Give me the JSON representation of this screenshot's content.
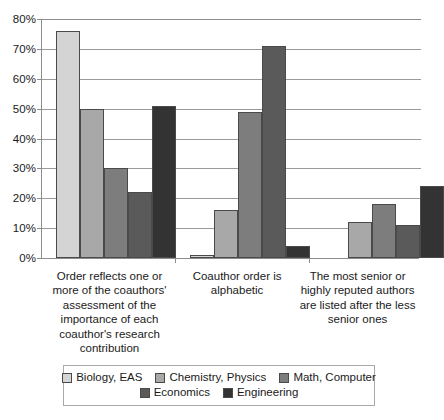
{
  "chart_data": {
    "type": "bar",
    "title": "",
    "subtitle": "",
    "xlabel": "",
    "ylabel": "",
    "ylim": [
      0,
      80
    ],
    "y_tick_labels": [
      "0%",
      "10%",
      "20%",
      "30%",
      "40%",
      "50%",
      "60%",
      "70%",
      "80%"
    ],
    "y_tick_values": [
      0,
      10,
      20,
      30,
      40,
      50,
      60,
      70,
      80
    ],
    "grid": true,
    "legend_position": "bottom",
    "categories": [
      "Order reflects one or more of the coauthors' assessment of the importance of each coauthor's research contribution",
      "Coauthor order is alphabetic",
      "The most senior or highly reputed authors are listed after the less senior ones"
    ],
    "series": [
      {
        "name": "Biology, EAS",
        "color": "#d4d4d4",
        "values": [
          76,
          1,
          0
        ]
      },
      {
        "name": "Chemistry, Physics",
        "color": "#a8a8a8",
        "values": [
          50,
          16,
          12
        ]
      },
      {
        "name": "Math, Computer",
        "color": "#7d7d7d",
        "values": [
          30,
          49,
          18
        ]
      },
      {
        "name": "Economics",
        "color": "#5a5a5a",
        "values": [
          22,
          71,
          11
        ]
      },
      {
        "name": "Engineering",
        "color": "#333333",
        "values": [
          51,
          4,
          24
        ]
      }
    ]
  },
  "legend": {
    "rows": [
      [
        "Biology, EAS",
        "Chemistry, Physics",
        "Math, Computer"
      ],
      [
        "Economics",
        "Engineering"
      ]
    ]
  },
  "axis": {
    "max_percent": 80
  }
}
